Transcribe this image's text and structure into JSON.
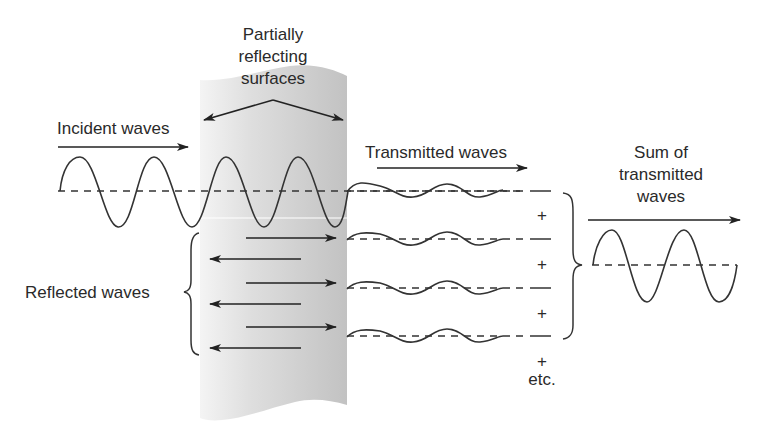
{
  "labels": {
    "partially_reflecting": [
      "Partially",
      "reflecting",
      "surfaces"
    ],
    "incident": "Incident waves",
    "transmitted": "Transmitted waves",
    "sum": [
      "Sum of",
      "transmitted",
      "waves"
    ],
    "reflected": "Reflected waves",
    "plus": "+",
    "etc": "etc."
  },
  "colors": {
    "slab_light": "#f2f2f2",
    "slab_dark": "#c4c4c4",
    "stroke": "#333333",
    "text": "#2a2a2a"
  },
  "structure": {
    "transmitted_wave_count": 4,
    "reflected_arrow_pairs": 3,
    "plus_signs": 4
  }
}
